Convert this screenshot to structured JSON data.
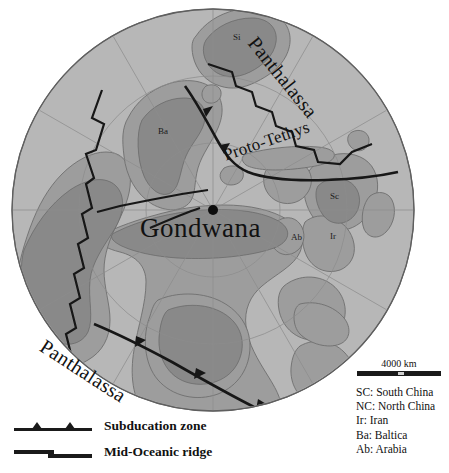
{
  "figure": {
    "name": "gondwana-paleogeographic-map",
    "center_label": "Gondwana",
    "ocean_labels": {
      "panthalassa_ne": "Panthalassa",
      "panthalassa_sw": "Panthalassa",
      "proto_tethys": "Proto-Tethys"
    },
    "terrane_labels": [
      {
        "code": "Si",
        "x": 233,
        "y": 32
      },
      {
        "code": "Ba",
        "x": 158,
        "y": 126
      },
      {
        "code": "Sc",
        "x": 330,
        "y": 191
      },
      {
        "code": "Ir",
        "x": 330,
        "y": 231
      },
      {
        "code": "Ab",
        "x": 291,
        "y": 232
      }
    ]
  },
  "scale": {
    "label": "4000 km"
  },
  "abbreviations": [
    "SC: South China",
    "NC: North China",
    "Ir: Iran",
    "Ba: Baltica",
    "Ab: Arabia"
  ],
  "symbol_legend": [
    {
      "icon": "subduction-zone-symbol",
      "label": "Subducation zone"
    },
    {
      "icon": "mid-oceanic-ridge-symbol",
      "label": "Mid-Oceanic ridge"
    }
  ],
  "bottom_caption": {
    "text": ""
  },
  "colors": {
    "background": "#ffffff",
    "ocean": "#b7b7b7",
    "continent": "#9a9a9a",
    "shelf": "#8c8c8c",
    "outline": "#6e6e6e",
    "graticule": "#8f8f8f",
    "tectonic_line": "#1a1a1a",
    "text": "#111111"
  },
  "geometry": {
    "globe_center_x": 213,
    "globe_center_y": 210,
    "globe_radius": 201
  }
}
